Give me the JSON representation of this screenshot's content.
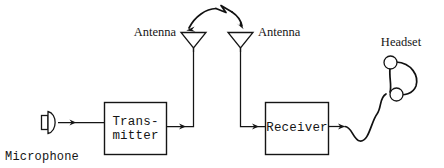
{
  "diagram": {
    "background_color": "#ffffff",
    "ink_color": "#151515",
    "nodes": {
      "microphone": {
        "label": "Microphone",
        "icon": "microphone-icon",
        "label_font": "monospace"
      },
      "transmitter": {
        "label_line1": "Trans-",
        "label_line2": "mitter",
        "label_font": "monospace"
      },
      "antenna_transmit": {
        "label": "Antenna",
        "icon": "antenna-icon",
        "label_font": "serif",
        "label_side": "left"
      },
      "antenna_receive": {
        "label": "Antenna",
        "icon": "antenna-icon",
        "label_font": "serif",
        "label_side": "right"
      },
      "receiver": {
        "label": "Receiver",
        "label_font": "monospace"
      },
      "headset": {
        "label": "Headset",
        "icon": "headset-icon",
        "label_font": "serif"
      }
    },
    "connections": [
      {
        "from": "microphone",
        "to": "transmitter",
        "style": "arrow"
      },
      {
        "from": "transmitter",
        "to": "antenna_transmit",
        "style": "arrow-elbow"
      },
      {
        "from": "antenna_transmit",
        "to": "antenna_receive",
        "style": "radio-wave-arc"
      },
      {
        "from": "antenna_receive",
        "to": "receiver",
        "style": "arrow-elbow"
      },
      {
        "from": "receiver",
        "to": "headset",
        "style": "arrow-cord"
      }
    ]
  }
}
